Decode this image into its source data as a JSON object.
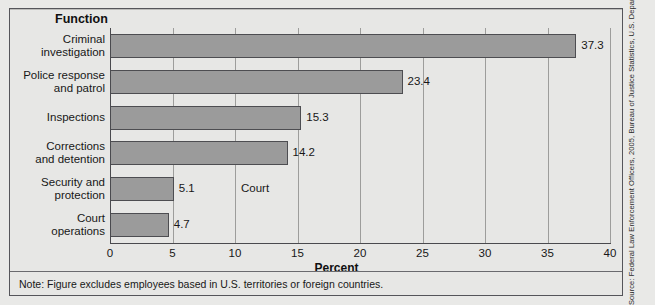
{
  "figure": {
    "function_heading": "Function",
    "axis_title": "Percent",
    "court_annotation": "Court",
    "note": "Note: Figure excludes employees based in U.S. territories or foreign countries.",
    "source": "Source: Federal Law Enforcement Officers, 2005, Bureau of Justice Statistics, U.S. Department of Justice",
    "clipped_title": "",
    "colors": {
      "bar_fill": "#9b9b9b",
      "bar_border": "#4d4d51",
      "background": "#e7e7e5",
      "gridline": "#9d9d9b",
      "axis": "#4a4a4e",
      "text": "#171717"
    }
  },
  "chart_data": {
    "type": "bar",
    "orientation": "horizontal",
    "title": "",
    "subtitle": "",
    "xlabel": "Percent",
    "ylabel": "Function",
    "xlim": [
      0,
      40
    ],
    "xticks": [
      0,
      5,
      10,
      15,
      20,
      25,
      30,
      35,
      40
    ],
    "xtick_labels": [
      "0",
      "5",
      "10",
      "15",
      "20",
      "25",
      "30",
      "35",
      "40"
    ],
    "grid": true,
    "grid_axis": "x",
    "legend": false,
    "categories": [
      "Criminal investigation",
      "Police response and patrol",
      "Inspections",
      "Corrections and detention",
      "Security and protection",
      "Court operations"
    ],
    "category_lines": [
      [
        "Criminal",
        "investigation"
      ],
      [
        "Police response",
        "and patrol"
      ],
      [
        "Inspections"
      ],
      [
        "Corrections",
        "and detention"
      ],
      [
        "Security and",
        "protection"
      ],
      [
        "Court",
        "operations"
      ]
    ],
    "values": [
      37.3,
      23.4,
      15.3,
      14.2,
      5.1,
      4.7
    ],
    "value_labels": [
      "37.3",
      "23.4",
      "15.3",
      "14.2",
      "5.1",
      "4.7"
    ],
    "annotations": [
      {
        "text": "Court",
        "x": 10.0,
        "y_category": "Security and protection"
      }
    ],
    "note": "Note: Figure excludes employees based in U.S. territories or foreign countries.",
    "source": "Source: Federal Law Enforcement Officers, 2005, Bureau of Justice Statistics, U.S. Department of Justice"
  }
}
